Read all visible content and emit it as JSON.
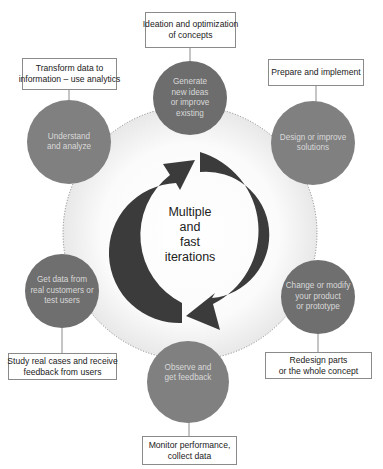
{
  "center": {
    "lines": [
      "Multiple",
      "and",
      "fast",
      "iterations"
    ]
  },
  "colors": {
    "node_fill": "#7f7f7f",
    "node_fill_dark": "#6d6d6d",
    "arrow": "#3b3b3b",
    "ring_edge": "#e9e9e9",
    "connector": "#8a8a8a"
  },
  "nodes": [
    {
      "id": "generate",
      "lines": [
        "Generate",
        "new ideas",
        "or improve",
        "existing"
      ],
      "box_lines": [
        "Ideation and optimization",
        "of concepts"
      ]
    },
    {
      "id": "design",
      "lines": [
        "Design or improve",
        "solutions"
      ],
      "box_lines": [
        "Prepare and implement"
      ]
    },
    {
      "id": "change",
      "lines": [
        "Change or modify",
        "your product",
        "or prototype"
      ],
      "box_lines": [
        "Redesign parts",
        "or the whole concept"
      ]
    },
    {
      "id": "observe",
      "lines": [
        "Observe and",
        "get feedback"
      ],
      "box_lines": [
        "Monitor performance,",
        "collect data"
      ]
    },
    {
      "id": "get-data",
      "lines": [
        "Get data from",
        "real customers or",
        "test users"
      ],
      "box_lines": [
        "Study real cases and receive",
        "feedback from users"
      ]
    },
    {
      "id": "understand",
      "lines": [
        "Understand",
        "and analyze"
      ],
      "box_lines": [
        "Transform data to",
        "information – use analytics"
      ]
    }
  ]
}
